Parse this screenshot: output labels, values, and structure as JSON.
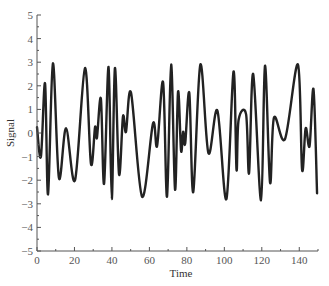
{
  "chart_data": {
    "type": "line",
    "title": "",
    "xlabel": "Time",
    "ylabel": "Signal",
    "xlim": [
      0,
      150
    ],
    "ylim": [
      -5,
      5
    ],
    "xticks": [
      0,
      20,
      40,
      60,
      80,
      100,
      120,
      140
    ],
    "yticks": [
      -5,
      -4,
      -3,
      -2,
      -1,
      0,
      1,
      2,
      3,
      4,
      5
    ],
    "xtick_labels": [
      "0",
      "20",
      "40",
      "60",
      "80",
      "100",
      "120",
      "140"
    ],
    "ytick_labels": [
      "−5",
      "−4",
      "−3",
      "−2",
      "−1",
      "0",
      "1",
      "2",
      "3",
      "4",
      "5"
    ],
    "grid": false,
    "legend": null,
    "line_color": "#222222",
    "series": [
      {
        "name": "Signal",
        "x": [
          0,
          2.1,
          4.3,
          5.9,
          8.5,
          11.7,
          15.5,
          20.3,
          25.6,
          28.8,
          31.0,
          32.0,
          34.1,
          35.8,
          38.2,
          39.9,
          41.6,
          43.8,
          45.9,
          47.5,
          50.2,
          56.1,
          61.9,
          64.1,
          67.3,
          69.4,
          71.6,
          73.7,
          75.3,
          76.9,
          78.0,
          79.1,
          81.3,
          83.4,
          87.2,
          91.5,
          96.3,
          101.1,
          104.9,
          106.5,
          107.6,
          111.6,
          113.2,
          115.4,
          119.6,
          121.7,
          124.4,
          126.5,
          132.4,
          139.3,
          141.5,
          143.4,
          145.5,
          147.6,
          149.5
        ],
        "y": [
          0.25,
          -1.0,
          2.1,
          -2.6,
          2.95,
          -1.9,
          0.2,
          -2.0,
          2.75,
          -1.3,
          0.25,
          -0.2,
          1.45,
          -2.15,
          2.8,
          -2.8,
          2.75,
          -1.75,
          0.7,
          0.05,
          1.7,
          -2.7,
          0.4,
          -0.55,
          2.15,
          -2.7,
          2.9,
          -2.4,
          1.75,
          -0.75,
          0.05,
          -0.45,
          1.7,
          -2.5,
          2.9,
          -0.85,
          0.95,
          -2.8,
          2.6,
          -1.55,
          0.55,
          0.8,
          -1.7,
          2.5,
          -2.85,
          2.85,
          -2.1,
          0.65,
          -0.25,
          2.9,
          -1.55,
          0.2,
          -0.55,
          1.85,
          -2.55
        ]
      }
    ]
  }
}
